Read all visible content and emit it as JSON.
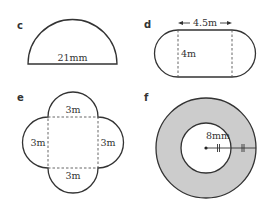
{
  "colors": {
    "stroke": "#333333",
    "annulus_fill": "#cccccc",
    "background": "#ffffff"
  },
  "figures": [
    {
      "id": "c",
      "label": "c",
      "shape": "semicircle",
      "dimensions": [
        "21mm"
      ]
    },
    {
      "id": "d",
      "label": "d",
      "shape": "stadium",
      "dimensions": [
        "4.5m",
        "4m"
      ]
    },
    {
      "id": "e",
      "label": "e",
      "shape": "square with four semicircles",
      "dimensions": [
        "3m",
        "3m",
        "3m",
        "3m"
      ]
    },
    {
      "id": "f",
      "label": "f",
      "shape": "annulus",
      "dimensions": [
        "8mm"
      ]
    }
  ]
}
